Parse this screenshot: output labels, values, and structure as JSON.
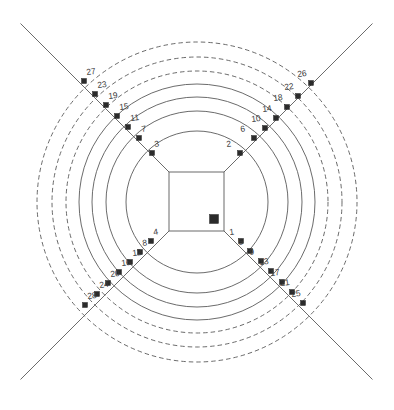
{
  "figure": {
    "title": "",
    "kind": "concentric-ring-diagram",
    "background_color": "#ffffff",
    "line_color": "#5a5a5a",
    "marker_color": "#2b2b2b",
    "label_color": "#3a3a3a"
  },
  "geometry": {
    "center": {
      "x": 197,
      "y": 202
    },
    "inner_square": {
      "x": 169,
      "y": 172,
      "width": 55,
      "height": 59
    },
    "ring_radii": [
      71,
      91,
      105,
      118,
      131,
      145,
      160
    ],
    "ring_styles": [
      "solid",
      "solid",
      "solid",
      "solid",
      "dashed",
      "dashed",
      "dashed"
    ],
    "diagonal_directions": [
      "northeast",
      "northwest",
      "southwest",
      "southeast"
    ],
    "diagonal_outer_length": 210
  },
  "chart_data": {
    "type": "scatter",
    "title": "",
    "xlabel": "",
    "ylabel": "",
    "grid": true,
    "legend": "none",
    "rings": 7,
    "spokes": 4,
    "points": [
      {
        "label": "1",
        "ring": 1,
        "spoke": "southeast",
        "x": 241,
        "y": 241
      },
      {
        "label": "2",
        "ring": 1,
        "spoke": "northeast",
        "x": 240,
        "y": 153
      },
      {
        "label": "3",
        "ring": 1,
        "spoke": "northwest",
        "x": 152,
        "y": 153
      },
      {
        "label": "4",
        "ring": 1,
        "spoke": "southwest",
        "x": 151,
        "y": 241
      },
      {
        "label": "5",
        "ring": 2,
        "spoke": "southeast",
        "x": 250,
        "y": 251
      },
      {
        "label": "6",
        "ring": 2,
        "spoke": "northeast",
        "x": 254,
        "y": 138
      },
      {
        "label": "7",
        "ring": 2,
        "spoke": "northwest",
        "x": 139,
        "y": 138
      },
      {
        "label": "8",
        "ring": 2,
        "spoke": "southwest",
        "x": 140,
        "y": 252
      },
      {
        "label": "9",
        "ring": 3,
        "spoke": "southeast",
        "x": 261,
        "y": 261
      },
      {
        "label": "10",
        "ring": 3,
        "spoke": "northeast",
        "x": 265,
        "y": 128
      },
      {
        "label": "11",
        "ring": 3,
        "spoke": "northwest",
        "x": 128,
        "y": 127
      },
      {
        "label": "12",
        "ring": 3,
        "spoke": "southwest",
        "x": 130,
        "y": 262
      },
      {
        "label": "13",
        "ring": 4,
        "spoke": "southeast",
        "x": 271,
        "y": 271
      },
      {
        "label": "14",
        "ring": 4,
        "spoke": "northeast",
        "x": 276,
        "y": 118
      },
      {
        "label": "15",
        "ring": 4,
        "spoke": "northwest",
        "x": 117,
        "y": 116
      },
      {
        "label": "16",
        "ring": 4,
        "spoke": "southwest",
        "x": 119,
        "y": 272
      },
      {
        "label": "17",
        "ring": 5,
        "spoke": "southeast",
        "x": 282,
        "y": 282
      },
      {
        "label": "18",
        "ring": 5,
        "spoke": "northeast",
        "x": 287,
        "y": 107
      },
      {
        "label": "19",
        "ring": 5,
        "spoke": "northwest",
        "x": 106,
        "y": 105
      },
      {
        "label": "20",
        "ring": 5,
        "spoke": "southwest",
        "x": 108,
        "y": 283
      },
      {
        "label": "21",
        "ring": 6,
        "spoke": "southeast",
        "x": 292,
        "y": 292
      },
      {
        "label": "22",
        "ring": 6,
        "spoke": "northeast",
        "x": 298,
        "y": 96
      },
      {
        "label": "23",
        "ring": 6,
        "spoke": "northwest",
        "x": 95,
        "y": 94
      },
      {
        "label": "24",
        "ring": 6,
        "spoke": "southwest",
        "x": 97,
        "y": 294
      },
      {
        "label": "25",
        "ring": 7,
        "spoke": "southeast",
        "x": 303,
        "y": 303
      },
      {
        "label": "26",
        "ring": 7,
        "spoke": "northeast",
        "x": 311,
        "y": 83
      },
      {
        "label": "27",
        "ring": 7,
        "spoke": "northwest",
        "x": 84,
        "y": 81
      },
      {
        "label": "28",
        "ring": 7,
        "spoke": "southwest",
        "x": 85,
        "y": 305
      }
    ],
    "highlight_marker": {
      "label": "",
      "x": 214,
      "y": 219,
      "size": 9,
      "color": "#2b2b2b"
    }
  }
}
